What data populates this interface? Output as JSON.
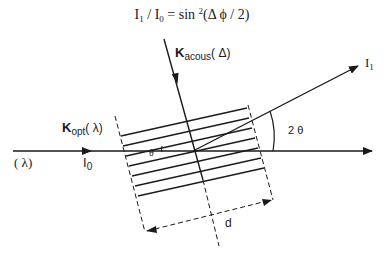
{
  "equation": {
    "lhs": "I",
    "lhs_sub": "1",
    "slash": " / I",
    "rhs_sub": "0",
    "equals": " = sin ",
    "power": "2",
    "arg": "(Δ ϕ / 2)"
  },
  "labels": {
    "k_acous_main": "K",
    "k_acous_sub": "acous",
    "k_acous_arg": "( Δ)",
    "k_opt_main": "K",
    "k_opt_sub": "opt",
    "k_opt_arg": "( λ)",
    "lambda_input": "( λ)",
    "i0_main": "I",
    "i0_sub": "0",
    "i1_main": "I",
    "i1_sub": "1",
    "two_theta": "2 θ",
    "theta": "θ",
    "d": "d"
  },
  "colors": {
    "line": "#1a1a1a",
    "background": "#ffffff"
  }
}
